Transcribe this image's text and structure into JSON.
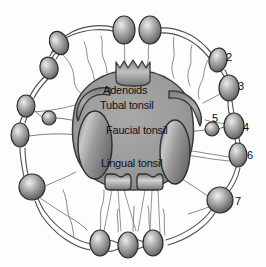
{
  "figure": {
    "kind": "anatomical-diagram",
    "background_color": "#fdfdfd",
    "ink_color": "#101010"
  },
  "palette": {
    "pharynx_fill": "#9b9b9b",
    "pharynx_edge": "#3a3a3a",
    "tonsil_fill": "#8f8f8f",
    "tonsil_edge": "#2f2f2f",
    "node_fill": "#8a8a8a",
    "node_edge": "#2b2b2b",
    "node_highlight": "#e8e8e8",
    "vessel_stroke": "#4a4a4a",
    "vessel_thin": "#6e6e6e"
  },
  "structure_labels": [
    {
      "id": "adenoids",
      "text": "Adenoids",
      "x": 103,
      "y": 85
    },
    {
      "id": "tubal-tonsil",
      "text": "Tubal tonsil",
      "x": 100,
      "y": 100
    },
    {
      "id": "faucial-tonsil",
      "text": "Faucial tonsil",
      "x": 106,
      "y": 125
    },
    {
      "id": "lingual-tonsil",
      "text": "Lingual tonsil",
      "x": 101,
      "y": 158
    }
  ],
  "node_labels": [
    {
      "id": "node-2",
      "text": "2",
      "x": 226,
      "y": 52
    },
    {
      "id": "node-3",
      "text": "3",
      "x": 238,
      "y": 81
    },
    {
      "id": "node-4",
      "text": "4",
      "x": 243,
      "y": 122
    },
    {
      "id": "node-5",
      "text": "5",
      "x": 212,
      "y": 113
    },
    {
      "id": "node-6",
      "text": "6",
      "x": 247,
      "y": 150
    },
    {
      "id": "node-7",
      "text": "7",
      "x": 235,
      "y": 196
    }
  ],
  "lymph_nodes": [
    {
      "id": "node-top-left-a",
      "cx": 59,
      "cy": 43,
      "rx": 9,
      "ry": 12,
      "rot": -25,
      "shape": "oval"
    },
    {
      "id": "node-top-left-b",
      "cx": 49,
      "cy": 68,
      "rx": 9,
      "ry": 11,
      "rot": -15,
      "shape": "oval"
    },
    {
      "id": "node-top-center-a",
      "cx": 124,
      "cy": 30,
      "rx": 11,
      "ry": 14,
      "rot": 0,
      "shape": "oval"
    },
    {
      "id": "node-top-center-b",
      "cx": 150,
      "cy": 30,
      "rx": 11,
      "ry": 14,
      "rot": 0,
      "shape": "oval"
    },
    {
      "id": "node-2-body",
      "cx": 218,
      "cy": 60,
      "rx": 9,
      "ry": 12,
      "rot": 10,
      "shape": "oval"
    },
    {
      "id": "node-3-body",
      "cx": 229,
      "cy": 88,
      "rx": 10,
      "ry": 13,
      "rot": 0,
      "shape": "oval"
    },
    {
      "id": "node-4-body",
      "cx": 234,
      "cy": 126,
      "rx": 10,
      "ry": 13,
      "rot": 0,
      "shape": "oval"
    },
    {
      "id": "node-5-body",
      "cx": 212,
      "cy": 129,
      "rx": 7,
      "ry": 7,
      "rot": 0,
      "shape": "round"
    },
    {
      "id": "node-6-body",
      "cx": 238,
      "cy": 155,
      "rx": 9,
      "ry": 12,
      "rot": 0,
      "shape": "oval"
    },
    {
      "id": "node-7-body",
      "cx": 220,
      "cy": 200,
      "rx": 13,
      "ry": 13,
      "rot": 0,
      "shape": "round"
    },
    {
      "id": "node-left-a",
      "cx": 26,
      "cy": 106,
      "rx": 9,
      "ry": 11,
      "rot": 0,
      "shape": "oval"
    },
    {
      "id": "node-left-inner",
      "cx": 49,
      "cy": 118,
      "rx": 7,
      "ry": 7,
      "rot": 0,
      "shape": "round"
    },
    {
      "id": "node-left-b",
      "cx": 20,
      "cy": 135,
      "rx": 9,
      "ry": 12,
      "rot": 0,
      "shape": "oval"
    },
    {
      "id": "node-left-lower",
      "cx": 32,
      "cy": 187,
      "rx": 13,
      "ry": 13,
      "rot": 0,
      "shape": "round"
    },
    {
      "id": "node-bottom-a",
      "cx": 100,
      "cy": 243,
      "rx": 10,
      "ry": 13,
      "rot": 0,
      "shape": "oval"
    },
    {
      "id": "node-bottom-b",
      "cx": 128,
      "cy": 245,
      "rx": 10,
      "ry": 13,
      "rot": 0,
      "shape": "oval"
    },
    {
      "id": "node-bottom-c",
      "cx": 153,
      "cy": 243,
      "rx": 10,
      "ry": 13,
      "rot": 0,
      "shape": "oval"
    }
  ],
  "tonsil_structures": [
    {
      "id": "pharynx-mass",
      "name": "pharyngeal-mass"
    },
    {
      "id": "adenoid-mass",
      "name": "adenoid-pad"
    },
    {
      "id": "tubal-left",
      "name": "tubal-tonsil-left"
    },
    {
      "id": "tubal-right",
      "name": "tubal-tonsil-right"
    },
    {
      "id": "faucial-left",
      "name": "faucial-tonsil-left"
    },
    {
      "id": "faucial-right",
      "name": "faucial-tonsil-right"
    },
    {
      "id": "lingual-left",
      "name": "lingual-tonsil-left"
    },
    {
      "id": "lingual-right",
      "name": "lingual-tonsil-right"
    }
  ]
}
